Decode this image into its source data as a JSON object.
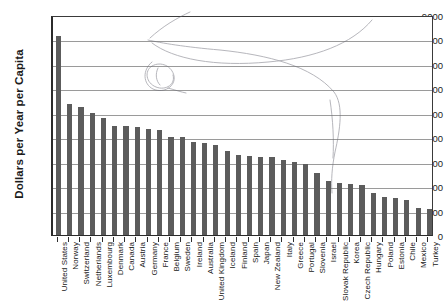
{
  "chart_data": {
    "type": "bar",
    "title": "",
    "xlabel": "",
    "ylabel": "Dollars per Year per Capita",
    "ylim": [
      0,
      9000
    ],
    "ytick_values": [
      0,
      1000,
      2000,
      3000,
      4000,
      5000,
      6000,
      7000,
      8000,
      9000
    ],
    "ytick_labels": [
      "0",
      "1000",
      "2000",
      "3000",
      "4000",
      "5000",
      "6000",
      "7000",
      "8000",
      "9000"
    ],
    "grid": "horizontal",
    "legend": "none",
    "bar_color": "#5c5c5c",
    "categories": [
      "United States",
      "Norway",
      "Switzerland",
      "Netherlands",
      "Luxembourg",
      "Denmark",
      "Canada",
      "Austria",
      "Germany",
      "France",
      "Belgium",
      "Sweden",
      "Ireland",
      "Australia",
      "United Kingdom",
      "Iceland",
      "Finland",
      "Spain",
      "Japan",
      "New Zealand",
      "Italy",
      "Greece",
      "Portugal",
      "Slovenia",
      "Israel",
      "Slovak Republic",
      "Korea",
      "Czech Republic",
      "Hungary",
      "Poland",
      "Estonia",
      "Chile",
      "Mexico",
      "Turkey"
    ],
    "values": [
      8150,
      5350,
      5250,
      5000,
      4780,
      4460,
      4440,
      4400,
      4330,
      4290,
      4000,
      3990,
      3790,
      3770,
      3670,
      3420,
      3270,
      3230,
      3200,
      3180,
      3050,
      2980,
      2900,
      2550,
      2230,
      2130,
      2100,
      2030,
      1700,
      1560,
      1500,
      1450,
      1100,
      1070
    ],
    "annotations": [
      {
        "name": "pen-loop-scribble",
        "description": "handwritten ink loop near upper-left plot area"
      },
      {
        "name": "pen-curve-left",
        "description": "long faint ink curve sweeping right"
      },
      {
        "name": "pen-line-right",
        "description": "faint ink line descending through right half"
      }
    ]
  }
}
